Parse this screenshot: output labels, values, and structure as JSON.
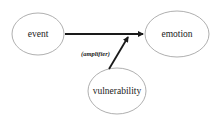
{
  "diagram": {
    "nodes": [
      {
        "id": "event",
        "label": "event"
      },
      {
        "id": "emotion",
        "label": "emotion"
      },
      {
        "id": "vulnerability",
        "label": "vulnerability"
      }
    ],
    "edges": [
      {
        "from": "event",
        "to": "emotion",
        "label": ""
      },
      {
        "from": "vulnerability",
        "to": "event-emotion-edge",
        "label": "(amplifier)"
      }
    ],
    "colors": {
      "node_stroke": "#9a9a9a",
      "edge": "#1a1a1a",
      "text": "#222222"
    }
  }
}
